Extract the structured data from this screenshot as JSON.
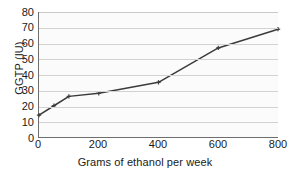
{
  "chart_data": {
    "type": "line",
    "title": "",
    "xlabel": "Grams of ethanol per week",
    "ylabel": "GGTP (IU)",
    "xlim": [
      0,
      800
    ],
    "ylim": [
      0,
      80
    ],
    "xticks": [
      "0",
      "200",
      "400",
      "600",
      "800"
    ],
    "xtick_values": [
      0,
      200,
      400,
      600,
      800
    ],
    "yticks": [
      "0",
      "10",
      "20",
      "30",
      "40",
      "50",
      "60",
      "70",
      "80"
    ],
    "ytick_values": [
      0,
      10,
      20,
      30,
      40,
      50,
      60,
      70,
      80
    ],
    "grid": "horizontal",
    "legend": "none",
    "series": [
      {
        "name": "GGTP",
        "x": [
          0,
          50,
          100,
          200,
          400,
          600,
          800
        ],
        "values": [
          14,
          20,
          26,
          28,
          35,
          57,
          69
        ],
        "color": "#3b3b3b",
        "marker": "plus"
      }
    ]
  },
  "colors": {
    "line": "#3b3b3b",
    "grid": "#d2d2d2",
    "axis": "#6e6e6e",
    "text": "#1a1a1a",
    "plot_background": "#fbfbfb"
  }
}
